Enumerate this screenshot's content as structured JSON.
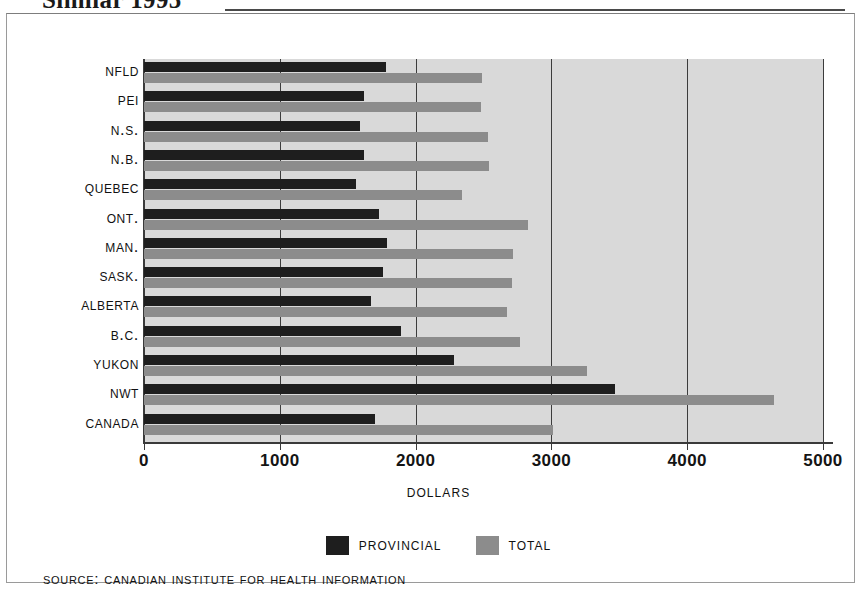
{
  "headline": {
    "text": "Similar 1995"
  },
  "chart_data": {
    "type": "bar",
    "orientation": "horizontal",
    "title": "",
    "xlabel": "Dollars",
    "ylabel": "",
    "xlim": [
      0,
      5000
    ],
    "xticks": [
      0,
      1000,
      2000,
      3000,
      4000,
      5000
    ],
    "xtick_labels": [
      "0",
      "1000",
      "2000",
      "3000",
      "4000",
      "5000"
    ],
    "grid": true,
    "grid_axis": "x",
    "legend_position": "bottom-center",
    "categories": [
      "Nfld",
      "PEI",
      "N.S.",
      "N.B.",
      "Quebec",
      "Ont.",
      "Man.",
      "Sask.",
      "Alberta",
      "B.C.",
      "Yukon",
      "NWT",
      "Canada"
    ],
    "series": [
      {
        "name": "Provincial",
        "color": "#1e1e1e",
        "values": [
          1780,
          1620,
          1590,
          1620,
          1560,
          1730,
          1790,
          1760,
          1670,
          1890,
          2280,
          3470,
          1700
        ]
      },
      {
        "name": "Total",
        "color": "#8c8c8c",
        "values": [
          2490,
          2480,
          2530,
          2540,
          2340,
          2830,
          2720,
          2710,
          2670,
          2770,
          3260,
          4640,
          3010
        ]
      }
    ]
  },
  "legend": {
    "entries": [
      {
        "label": "Provincial",
        "color": "#1e1e1e"
      },
      {
        "label": "Total",
        "color": "#8c8c8c"
      }
    ]
  },
  "source": {
    "text": "Source: Canadian Institute for Health Information"
  }
}
